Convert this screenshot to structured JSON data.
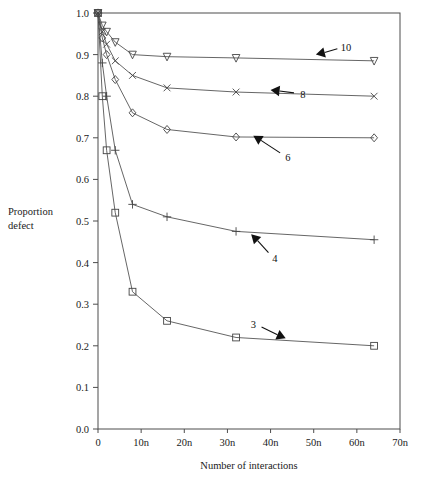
{
  "chart_data": {
    "type": "line",
    "title": "",
    "subtitle": "",
    "xlabel": "Number of interactions",
    "ylabel": "Proportion defect",
    "ylabel_lines": [
      "Proportion",
      "defect"
    ],
    "xlim": [
      0,
      70
    ],
    "ylim": [
      0.0,
      1.0
    ],
    "grid": false,
    "legend_position": "inline-annotations",
    "x_tick_labels": [
      "0",
      "10n",
      "20n",
      "30n",
      "40n",
      "50n",
      "60n",
      "70n"
    ],
    "x_tick_values": [
      0,
      10,
      20,
      30,
      40,
      50,
      60,
      70
    ],
    "y_tick_labels": [
      "0.0",
      "0.1",
      "0.2",
      "0.3",
      "0.4",
      "0.5",
      "0.6",
      "0.7",
      "0.8",
      "0.9",
      "1.0"
    ],
    "y_tick_values": [
      0.0,
      0.1,
      0.2,
      0.3,
      0.4,
      0.5,
      0.6,
      0.7,
      0.8,
      0.9,
      1.0
    ],
    "x": [
      0,
      1,
      2,
      4,
      8,
      16,
      32,
      64
    ],
    "series": [
      {
        "name": "10",
        "marker": "triangle-down",
        "values": [
          1.0,
          0.97,
          0.955,
          0.93,
          0.9,
          0.895,
          0.892,
          0.885
        ],
        "annotation": {
          "label": "10",
          "label_x": 57.5,
          "label_y": 0.918,
          "tip_x": 50.5,
          "tip_y": 0.9,
          "direction": "up-left"
        }
      },
      {
        "name": "8",
        "marker": "cross-x",
        "values": [
          1.0,
          0.955,
          0.925,
          0.885,
          0.85,
          0.82,
          0.81,
          0.8
        ],
        "annotation": {
          "label": "8",
          "label_x": 47.5,
          "label_y": 0.806,
          "tip_x": 40.0,
          "tip_y": 0.815,
          "direction": "up-left"
        }
      },
      {
        "name": "6",
        "marker": "diamond",
        "values": [
          1.0,
          0.94,
          0.9,
          0.84,
          0.76,
          0.72,
          0.702,
          0.7
        ],
        "annotation": {
          "label": "6",
          "label_x": 44.0,
          "label_y": 0.655,
          "tip_x": 36.0,
          "tip_y": 0.705,
          "direction": "up-left"
        }
      },
      {
        "name": "4",
        "marker": "plus",
        "values": [
          1.0,
          0.88,
          0.8,
          0.67,
          0.54,
          0.51,
          0.475,
          0.455
        ],
        "annotation": {
          "label": "4",
          "label_x": 41.0,
          "label_y": 0.412,
          "tip_x": 35.5,
          "tip_y": 0.468,
          "direction": "up-left"
        }
      },
      {
        "name": "3",
        "marker": "square",
        "values": [
          1.0,
          0.8,
          0.67,
          0.52,
          0.33,
          0.26,
          0.22,
          0.2
        ],
        "annotation": {
          "label": "3",
          "label_x": 36.0,
          "label_y": 0.252,
          "tip_x": 43.5,
          "tip_y": 0.218,
          "direction": "down-right"
        }
      }
    ]
  },
  "figure": {
    "background": "#ffffff",
    "line_color": "#555555",
    "axis_color": "#4d4d4d",
    "text_color": "#1a1a1a"
  }
}
